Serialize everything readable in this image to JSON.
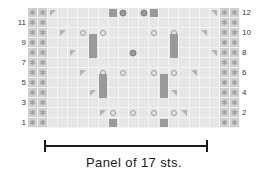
{
  "chart_data": {
    "type": "table",
    "caption": "Panel of 17 sts.",
    "columns": 21,
    "rows": 12,
    "panel_stitches": 17,
    "border_columns_left": 2,
    "border_columns_right": 2,
    "row_numbers_left": [
      "11",
      "9",
      "7",
      "5",
      "3",
      "1"
    ],
    "row_numbers_right": [
      "12",
      "10",
      "8",
      "6",
      "4",
      "2"
    ],
    "legend_symbols": [
      "star-icon",
      "open-circle-icon",
      "filled-dot-icon",
      "triangle-right-icon",
      "triangle-left-icon",
      "filled-square-icon",
      "filled-bar-icon"
    ],
    "colors": {
      "grid_background": "#e6e6e6",
      "border_column_background": "#cfcfcf",
      "gridline": "#f4f4f4",
      "symbol": "#9a9a9a",
      "triangle": "#b4b4b4",
      "text": "#1a1a1a"
    },
    "grid": [
      {
        "row": 12,
        "cells": [
          "star",
          "star",
          "tri-r",
          "",
          "",
          "",
          "",
          "",
          "square",
          "dot",
          "",
          "dot",
          "square",
          "",
          "",
          "",
          "",
          "",
          "tri-l",
          "star",
          "star"
        ]
      },
      {
        "row": 11,
        "cells": [
          "star",
          "star",
          "",
          "",
          "",
          "",
          "",
          "",
          "",
          "",
          "",
          "",
          "",
          "",
          "",
          "",
          "",
          "",
          "",
          "star",
          "star"
        ]
      },
      {
        "row": 10,
        "cells": [
          "star",
          "star",
          "",
          "tri-r",
          "",
          "circle",
          "",
          "circle",
          "",
          "",
          "",
          "",
          "circle",
          "",
          "circle",
          "",
          "",
          "tri-l",
          "",
          "star",
          "star"
        ]
      },
      {
        "row": 9,
        "cells": [
          "star",
          "star",
          "",
          "",
          "",
          "",
          "bar",
          "",
          "",
          "",
          "",
          "",
          "",
          "",
          "bar",
          "",
          "",
          "",
          "",
          "star",
          "star"
        ]
      },
      {
        "row": 8,
        "cells": [
          "star",
          "star",
          "",
          "",
          "tri-r",
          "",
          "bar",
          "",
          "",
          "",
          "dot",
          "",
          "",
          "",
          "bar",
          "",
          "",
          "",
          "tri-l",
          "star",
          "star"
        ]
      },
      {
        "row": 7,
        "cells": [
          "star",
          "star",
          "",
          "",
          "",
          "",
          "",
          "",
          "",
          "",
          "",
          "",
          "",
          "",
          "",
          "",
          "",
          "",
          "",
          "star",
          "star"
        ]
      },
      {
        "row": 6,
        "cells": [
          "star",
          "star",
          "",
          "",
          "",
          "tri-r",
          "",
          "circle",
          "",
          "circle",
          "",
          "",
          "circle",
          "",
          "circle",
          "",
          "tri-l",
          "",
          "",
          "star",
          "star"
        ]
      },
      {
        "row": 5,
        "cells": [
          "star",
          "star",
          "",
          "",
          "",
          "",
          "",
          "bar",
          "",
          "",
          "",
          "",
          "",
          "bar",
          "",
          "",
          "",
          "",
          "",
          "star",
          "star"
        ]
      },
      {
        "row": 4,
        "cells": [
          "star",
          "star",
          "",
          "",
          "",
          "",
          "tri-r",
          "bar",
          "",
          "",
          "",
          "",
          "",
          "bar",
          "tri-l",
          "",
          "",
          "",
          "",
          "star",
          "star"
        ]
      },
      {
        "row": 3,
        "cells": [
          "star",
          "star",
          "",
          "",
          "",
          "",
          "",
          "",
          "",
          "",
          "",
          "",
          "",
          "",
          "",
          "",
          "",
          "",
          "",
          "star",
          "star"
        ]
      },
      {
        "row": 2,
        "cells": [
          "star",
          "star",
          "",
          "",
          "",
          "",
          "",
          "tri-r",
          "circle",
          "",
          "circle",
          "",
          "circle",
          "",
          "circle",
          "tri-l",
          "",
          "",
          "",
          "star",
          "star"
        ]
      },
      {
        "row": 1,
        "cells": [
          "star",
          "star",
          "",
          "",
          "",
          "",
          "",
          "",
          "square",
          "",
          "",
          "",
          "",
          "square",
          "",
          "",
          "",
          "",
          "",
          "star",
          "star"
        ]
      }
    ]
  },
  "bracket": {
    "label": "panel-span-bracket"
  },
  "caption": {
    "text": "Panel of 17 sts."
  }
}
